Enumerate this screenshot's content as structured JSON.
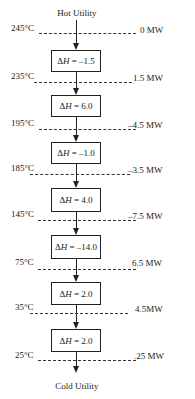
{
  "diagram": {
    "title_top": "Hot Utility",
    "title_bottom": "Cold Utility",
    "delta_symbol": "Δ",
    "delta_var": "H",
    "intervals": [
      {
        "temp": "245°C",
        "flow": "0 MW"
      },
      {
        "temp": "235°C",
        "flow": "1.5 MW"
      },
      {
        "temp": "195°C",
        "flow": "–4.5 MW"
      },
      {
        "temp": "185°C",
        "flow": "–3.5 MW"
      },
      {
        "temp": "145°C",
        "flow": "–7.5 MW"
      },
      {
        "temp": "75°C",
        "flow": "6.5 MW"
      },
      {
        "temp": "35°C",
        "flow": "4.5MW"
      },
      {
        "temp": "25°C",
        "flow": ".25 MW"
      }
    ],
    "boxes": [
      {
        "value": " = –1.5"
      },
      {
        "value": " = 6.0"
      },
      {
        "value": " = –1.0"
      },
      {
        "value": " = 4.0"
      },
      {
        "value": " = –14.0"
      },
      {
        "value": " = 2.0"
      },
      {
        "value": " = 2.0"
      }
    ]
  }
}
